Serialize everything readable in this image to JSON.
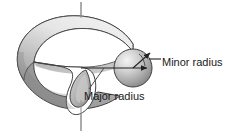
{
  "figure": {
    "type": "torus-geometry-diagram",
    "background_color": "#ffffff",
    "stroke_color": "#3a3a3a",
    "text_color": "#1a1a1a",
    "surface_colors": {
      "outer_dark": "#8f8f8f",
      "outer_mid": "#a9a9a9",
      "top_light": "#e9e9e9",
      "inner_shadow": "#7b7b7b",
      "cut_face": "#b5b5b5",
      "sphere_light": "#f2f2f2",
      "sphere_dark": "#7e7e7e"
    }
  },
  "labels": {
    "minor_radius": "Minor radius",
    "major_radius": "Major radius"
  },
  "annotations": {
    "axis_of_revolution": {
      "name": "vertical-axis",
      "x": 81,
      "y_top": 2,
      "y_bottom": 131
    },
    "major_radius_arrow": {
      "from_x": 81,
      "from_y": 68,
      "to_x": 148,
      "to_y": 68,
      "arrowhead": "right"
    },
    "minor_radius_arrow": {
      "from_x": 134,
      "from_y": 68,
      "to_x": 151,
      "to_y": 52,
      "arrowhead": "up-right"
    },
    "minor_leader": {
      "from_x": 152,
      "from_y": 60,
      "to_x": 162,
      "to_y": 60
    },
    "major_leader": {
      "from_x": 103,
      "from_y": 68,
      "to_x": 88,
      "to_y": 89
    }
  },
  "geometry": {
    "torus_center_x": 81,
    "torus_center_y": 66,
    "tube_sphere_center_x": 133,
    "tube_sphere_center_y": 68,
    "tube_sphere_radius": 19,
    "cutaway": true
  }
}
